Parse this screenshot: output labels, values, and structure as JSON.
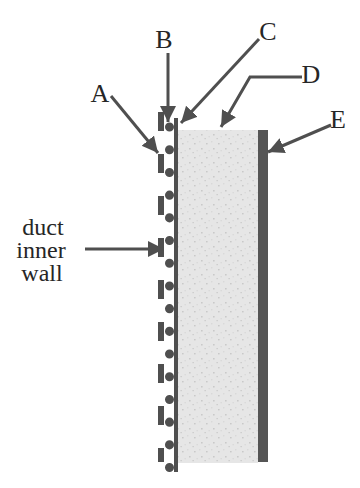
{
  "figure": {
    "callouts": [
      {
        "text": "A"
      },
      {
        "text": "B"
      },
      {
        "text": "C"
      },
      {
        "text": "D"
      },
      {
        "text": "E"
      }
    ],
    "duct_wall_label": {
      "line1": "duct",
      "line2": "inner",
      "line3": "wall"
    }
  },
  "colors": {
    "background": "#ffffff",
    "text_ink": "#262626",
    "line_ink": "#4f4f4f",
    "layer_fill": "#e6e6e6",
    "layer_speckle_dark": "#c9c9c9",
    "layer_speckle_light": "#d9d9d9",
    "bar_fill": "#555555"
  }
}
